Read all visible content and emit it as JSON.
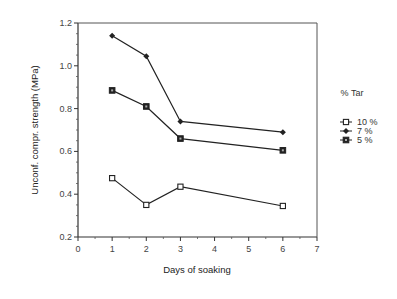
{
  "chart_data": {
    "type": "line",
    "title": "",
    "xlabel": "Days of soaking",
    "ylabel": "Unconf. compr. strength (MPa)",
    "xlim": [
      0,
      7
    ],
    "ylim": [
      0.2,
      1.2
    ],
    "xticks": [
      0,
      1,
      2,
      3,
      4,
      5,
      6,
      7
    ],
    "yticks": [
      0.2,
      0.4,
      0.6,
      0.8,
      1.0,
      1.2
    ],
    "ytick_labels": [
      "0.2",
      "0.4",
      "0.6",
      "0.8",
      "1.0",
      "1.2"
    ],
    "grid": false,
    "legend": {
      "title": "% Tar",
      "position": "right",
      "entries": [
        "10 %",
        "7 %",
        "5 %"
      ]
    },
    "series": [
      {
        "name": "10 %",
        "marker": "open-square",
        "x": [
          1,
          2,
          3,
          6
        ],
        "y": [
          0.475,
          0.35,
          0.435,
          0.345
        ]
      },
      {
        "name": "7 %",
        "marker": "filled-diamond",
        "x": [
          1,
          2,
          3,
          6
        ],
        "y": [
          1.14,
          1.045,
          0.74,
          0.69
        ]
      },
      {
        "name": "5 %",
        "marker": "filled-square",
        "x": [
          1,
          2,
          3,
          6
        ],
        "y": [
          0.885,
          0.81,
          0.66,
          0.605
        ]
      }
    ]
  }
}
